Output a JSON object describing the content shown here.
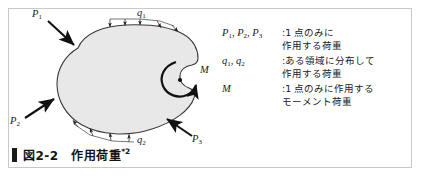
{
  "figure": {
    "caption_marker": "block-marker",
    "caption_text": "図2-2　作用荷重",
    "caption_note": "*2"
  },
  "diagram": {
    "labels": {
      "p1": "P",
      "p1_sub": "1",
      "p2": "P",
      "p2_sub": "2",
      "p3": "P",
      "p3_sub": "3",
      "q1": "q",
      "q1_sub": "1",
      "q2": "q",
      "q2_sub": "2",
      "m": "M"
    },
    "body_fill": "#e8e8e8",
    "outline_color": "#3a3a3a",
    "arrow_color": "#111111"
  },
  "legend": {
    "rows": [
      {
        "symbol_html": "P<sub>1</sub>,  P<sub>2</sub>,  P<sub>3</sub>",
        "symbols": [
          "P1",
          "P2",
          "P3"
        ],
        "description": ":1 点のみに\n 作用する荷重"
      },
      {
        "symbol_html": "q<sub>1</sub>,  q<sub>2</sub>",
        "symbols": [
          "q1",
          "q2"
        ],
        "description": ":ある領域に分布して\n 作用する荷重"
      },
      {
        "symbol_html": "M",
        "symbols": [
          "M"
        ],
        "description": ":1 点のみに作用する\n モーメント荷重"
      }
    ]
  },
  "colors": {
    "frame": "#c8c8c8",
    "background": "#ffffff",
    "text": "#1a1a1a"
  }
}
